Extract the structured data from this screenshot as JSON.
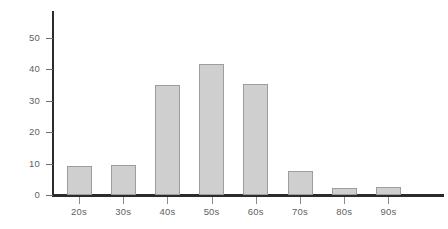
{
  "chart_data": {
    "type": "bar",
    "title": "",
    "subtitle": "",
    "xlabel": "",
    "ylabel": "",
    "categories": [
      "20s",
      "30s",
      "40s",
      "50s",
      "60s",
      "70s",
      "80s",
      "90s"
    ],
    "values": [
      9.3,
      9.5,
      35.0,
      41.5,
      35.3,
      7.7,
      2.3,
      2.4
    ],
    "ylim": [
      0,
      56
    ],
    "yticks": [
      0,
      10,
      20,
      30,
      40,
      50
    ],
    "ytick_labels": [
      "0",
      "10",
      "20",
      "30",
      "40",
      "50"
    ],
    "xtick_labels": [
      "20s",
      "30s",
      "40s",
      "50s",
      "60s",
      "70s",
      "80s",
      "90s"
    ],
    "grid": false,
    "legend": null,
    "legend_position": "none",
    "annotations": [],
    "colors": {
      "bar_fill": "#cfcfcf",
      "bar_border": "#9d9d9d",
      "axis": "#2b2b2b",
      "tick_label": "#5f5f5f",
      "background": "#ffffff"
    }
  }
}
